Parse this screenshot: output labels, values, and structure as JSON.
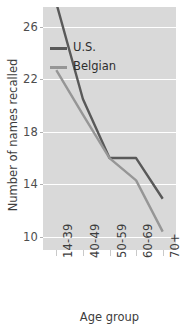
{
  "chart_data": {
    "type": "line",
    "title": "",
    "xlabel": "Age group",
    "ylabel": "Number of names recalled",
    "categories": [
      "14-39",
      "40-49",
      "50-59",
      "60-69",
      "70+"
    ],
    "series": [
      {
        "name": "U.S.",
        "color": "#595959",
        "values": [
          27.8,
          20.5,
          16.0,
          16.0,
          12.9
        ]
      },
      {
        "name": "Belgian",
        "color": "#969696",
        "values": [
          22.7,
          19.3,
          16.0,
          14.3,
          10.4
        ]
      }
    ],
    "ylim": [
      9.0,
      27.5
    ],
    "yticks": [
      10,
      14,
      18,
      22,
      26
    ],
    "ytick_labels": [
      "10",
      "14",
      "18",
      "22",
      "26"
    ],
    "grid": true,
    "legend_position": "upper center",
    "plot_background": "#d9d9d9",
    "gridline_color": "#ffffff",
    "figure_background": "#ffffff",
    "note": "U.S. series is clipped at the top edge of the plot panel"
  },
  "axes": {
    "y_title": "Number of names recalled",
    "x_title": "Age group"
  },
  "legend": {
    "items": [
      {
        "label": "U.S."
      },
      {
        "label": "Belgian"
      }
    ]
  }
}
